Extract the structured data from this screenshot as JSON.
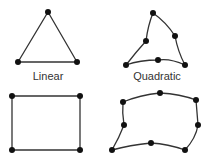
{
  "colors": {
    "line": "#333333",
    "node": "#111111",
    "background": "#ffffff"
  },
  "labels": {
    "linear": {
      "text": "Linear",
      "x": 48,
      "y": 70
    },
    "quadratic": {
      "text": "Quadratic",
      "x": 157,
      "y": 70
    }
  },
  "elements": [
    {
      "name": "linear-triangle",
      "order": "linear",
      "shape": "triangle",
      "path": "M48,12 L77,62 L18,62 Z",
      "nodes": [
        [
          48,
          12
        ],
        [
          77,
          62
        ],
        [
          18,
          62
        ]
      ]
    },
    {
      "name": "quadratic-triangle",
      "order": "quadratic",
      "shape": "triangle",
      "path": "M153,13 Q166,22 175,36 Q178,52 185,65 Q170,58 158,60 Q140,60 126,65 Q136,52 146,41 Q148,25 153,13 Z",
      "nodes": [
        [
          153,
          13
        ],
        [
          175,
          36
        ],
        [
          185,
          65
        ],
        [
          158,
          60
        ],
        [
          126,
          65
        ],
        [
          146,
          41
        ]
      ]
    },
    {
      "name": "linear-quadrilateral",
      "order": "linear",
      "shape": "quadrilateral",
      "path": "M12,96 L80,96 L80,150 L12,150 Z",
      "nodes": [
        [
          12,
          96
        ],
        [
          80,
          96
        ],
        [
          80,
          150
        ],
        [
          12,
          150
        ]
      ]
    },
    {
      "name": "quadratic-quadrilateral",
      "order": "quadratic",
      "shape": "quadrilateral",
      "path": "M123,102 Q140,95 160,93 Q180,94 196,100 Q197,112 198,125 Q196,138 185,150 Q168,144 151,143 Q130,145 112,150 Q119,138 124,125 Q122,113 123,102 Z",
      "nodes": [
        [
          123,
          102
        ],
        [
          160,
          93
        ],
        [
          196,
          100
        ],
        [
          198,
          125
        ],
        [
          185,
          150
        ],
        [
          151,
          143
        ],
        [
          112,
          150
        ],
        [
          124,
          125
        ]
      ]
    }
  ]
}
